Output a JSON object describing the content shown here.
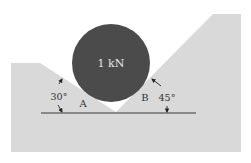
{
  "diagram": {
    "type": "statics-free-body",
    "cylinder": {
      "label": "1 kN",
      "fill": "#4b4b4b",
      "text_color": "#e6e6e6"
    },
    "ground_color": "#d9d9d9",
    "line_color": "#3a3a3a",
    "left_surface": {
      "contact_label": "A",
      "angle_label": "30°"
    },
    "right_surface": {
      "contact_label": "B",
      "angle_label": "45°"
    }
  }
}
